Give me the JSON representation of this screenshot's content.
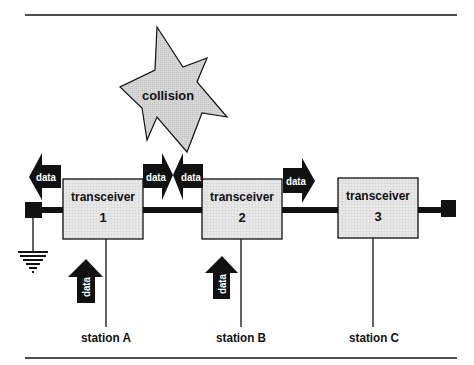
{
  "diagram": {
    "type": "network-bus-collision",
    "colors": {
      "line": "#111111",
      "box_fill": "#e8e8e8",
      "grid": "#c8c8c8",
      "star_fill": "#d4d4d4",
      "arrow_fill": "#111111",
      "arrow_text": "#ffffff"
    },
    "collision": {
      "label": "collision"
    },
    "transceivers": [
      {
        "label": "transceiver",
        "number": "1"
      },
      {
        "label": "transceiver",
        "number": "2"
      },
      {
        "label": "transceiver",
        "number": "3"
      }
    ],
    "stations": [
      {
        "label": "station A"
      },
      {
        "label": "station B"
      },
      {
        "label": "station C"
      }
    ],
    "bus_arrows": [
      {
        "label": "data",
        "direction": "left"
      },
      {
        "label": "data",
        "direction": "right"
      },
      {
        "label": "data",
        "direction": "left"
      },
      {
        "label": "data",
        "direction": "right"
      }
    ],
    "station_arrows": [
      {
        "label": "data",
        "direction": "up",
        "station": "A"
      },
      {
        "label": "data",
        "direction": "up",
        "station": "B"
      }
    ]
  }
}
